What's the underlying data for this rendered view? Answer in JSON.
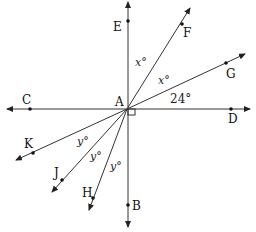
{
  "diagram": {
    "center": {
      "label": "A",
      "x": 127,
      "y": 109
    },
    "points": [
      {
        "label": "E",
        "x": 128,
        "y": 21
      },
      {
        "label": "F",
        "x": 182,
        "y": 24
      },
      {
        "label": "G",
        "x": 226,
        "y": 63
      },
      {
        "label": "D",
        "x": 231,
        "y": 109
      },
      {
        "label": "B",
        "x": 128,
        "y": 205
      },
      {
        "label": "H",
        "x": 93,
        "y": 198
      },
      {
        "label": "J",
        "x": 62,
        "y": 180
      },
      {
        "label": "K",
        "x": 33,
        "y": 153
      },
      {
        "label": "C",
        "x": 30,
        "y": 109
      }
    ],
    "angle_labels": {
      "x1": "x°",
      "x2": "x°",
      "angle_24": "24°",
      "y1": "y°",
      "y2": "y°",
      "y3": "y°"
    },
    "right_angle_marker": "right angle at A between AD and AB"
  }
}
